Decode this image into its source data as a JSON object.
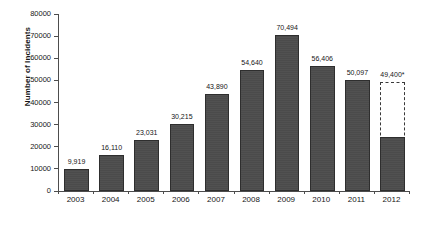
{
  "chart_data": {
    "type": "bar",
    "title": "",
    "xlabel": "",
    "ylabel": "Number of Incidents",
    "categories": [
      "2003",
      "2004",
      "2005",
      "2006",
      "2007",
      "2008",
      "2009",
      "2010",
      "2011",
      "2012"
    ],
    "values": [
      9919,
      16110,
      23031,
      30215,
      43890,
      54640,
      70494,
      56406,
      50097,
      24500
    ],
    "data_labels": [
      "9,919",
      "16,110",
      "23,031",
      "30,215",
      "43,890",
      "54,640",
      "70,494",
      "56,406",
      "50,097",
      "49,400*"
    ],
    "projected": [
      null,
      null,
      null,
      null,
      null,
      null,
      null,
      null,
      null,
      49400
    ],
    "ylim": [
      0,
      80000
    ],
    "ytick_values": [
      0,
      10000,
      20000,
      30000,
      40000,
      50000,
      60000,
      70000,
      80000
    ],
    "ytick_labels": [
      "0",
      "10000",
      "20000",
      "30000",
      "40000",
      "50000",
      "60000",
      "70000",
      "80000"
    ],
    "grid": false,
    "legend": "none",
    "series": [
      {
        "name": "Number of Incidents",
        "values": [
          9919,
          16110,
          23031,
          30215,
          43890,
          54640,
          70494,
          56406,
          50097,
          24500
        ],
        "color": "#4b4b4b"
      }
    ],
    "annotations": [
      {
        "category": "2012",
        "label": "49,400*",
        "kind": "projected-dashed-outline",
        "value": 49400
      }
    ],
    "colors": {
      "bar_fill": "#4b4b4b",
      "bar_border": "#2e2e2e",
      "axis": "#4d4d4d",
      "text": "#161616",
      "background": "#ffffff",
      "projection_outline": "#3a3a3a"
    }
  }
}
